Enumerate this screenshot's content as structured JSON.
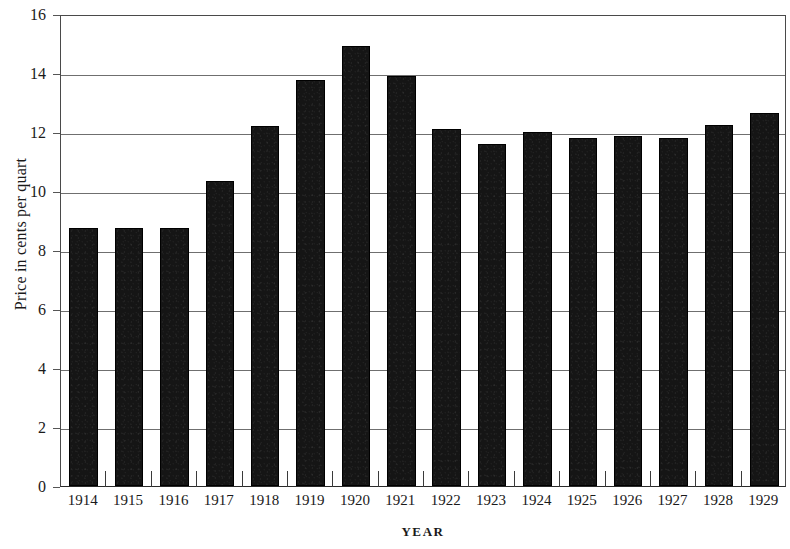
{
  "chart_data": {
    "type": "bar",
    "title": "",
    "xlabel": "YEAR",
    "ylabel": "Price in cents per quart",
    "categories": [
      "1914",
      "1915",
      "1916",
      "1917",
      "1918",
      "1919",
      "1920",
      "1921",
      "1922",
      "1923",
      "1924",
      "1925",
      "1926",
      "1927",
      "1928",
      "1929"
    ],
    "values": [
      8.75,
      8.75,
      8.75,
      10.35,
      12.2,
      13.75,
      14.9,
      13.9,
      12.1,
      11.6,
      12.0,
      11.8,
      11.85,
      11.8,
      12.25,
      12.65
    ],
    "series": [
      {
        "name": "Price in cents per quart",
        "values": [
          8.75,
          8.75,
          8.75,
          10.35,
          12.2,
          13.75,
          14.9,
          13.9,
          12.1,
          11.6,
          12.0,
          11.8,
          11.85,
          11.8,
          12.25,
          12.65
        ]
      }
    ],
    "ylim": [
      0,
      16
    ],
    "ytick_values": [
      0,
      2,
      4,
      6,
      8,
      10,
      12,
      14,
      16
    ],
    "ytick_labels": [
      "0",
      "2",
      "4",
      "6",
      "8",
      "10",
      "12",
      "14",
      "16"
    ],
    "grid": true,
    "grid_axis": "y",
    "legend": false,
    "legend_position": "none",
    "bar_color": "#151515",
    "axis_color": "#2a2a2a",
    "grid_color": "#6f6f6f",
    "background": "#ffffff"
  }
}
